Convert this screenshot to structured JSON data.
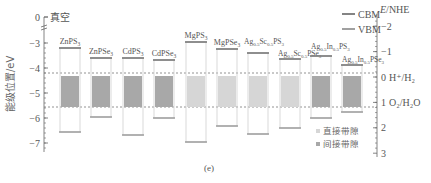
{
  "chart_data": {
    "type": "bar",
    "subtype": "band-edge floating bars",
    "panel_label": "(e)",
    "ylabel": "能级位置/eV",
    "ylabel_right": "E/NHE",
    "vacuum_label": "真空",
    "left_axis": {
      "ticks": [
        0,
        -3,
        -4,
        -5,
        -6,
        -7
      ],
      "range": [
        -7.4,
        0
      ],
      "axis_break_between": [
        0,
        -3
      ]
    },
    "right_axis": {
      "ticks": [
        -2,
        -1,
        0,
        1,
        2,
        3
      ],
      "range": [
        -2.4,
        3
      ]
    },
    "reference_lines": [
      {
        "label": "H+/H2",
        "label_display": "0 H⁺/H₂",
        "value_vacuum": -4.44,
        "value_nhe": 0
      },
      {
        "label": "O2/H2O",
        "label_display": "O₂/H₂O",
        "value_vacuum": -5.67,
        "value_nhe": 1.23
      }
    ],
    "legend": [
      {
        "key": "CBM",
        "label": "CBM"
      },
      {
        "key": "VBM",
        "label": "VBM"
      },
      {
        "key": "direct",
        "label": "直接带隙",
        "color": "#d6d6d6"
      },
      {
        "key": "indirect",
        "label": "间接带隙",
        "color": "#a8a8a8"
      }
    ],
    "categories": [
      "ZnPS3",
      "ZnPSe3",
      "CdPS3",
      "CdPSe3",
      "MgPS3",
      "MgPSe3",
      "Ag0.5Sc0.5PS3",
      "Ag0.5Sc0.5PSe3",
      "Ag0.5In0.5PS3",
      "Ag0.5In0.5PSe3"
    ],
    "series": [
      {
        "name": "CBM",
        "values": [
          -3.2,
          -3.6,
          -3.6,
          -3.68,
          -2.96,
          -3.24,
          -3.4,
          -3.64,
          -3.52,
          -3.88
        ]
      },
      {
        "name": "VBM",
        "values": [
          -6.56,
          -5.96,
          -6.68,
          -6.0,
          -6.96,
          -6.32,
          -6.64,
          -6.4,
          -6.0,
          -5.76
        ]
      }
    ],
    "gap_type": [
      "indirect",
      "indirect",
      "indirect",
      "indirect",
      "direct",
      "direct",
      "direct",
      "direct",
      "indirect",
      "indirect"
    ],
    "materials": [
      {
        "name": "ZnPS3",
        "base": "ZnPS",
        "sub": "3",
        "cbm": -3.2,
        "vbm": -6.56,
        "gap": "indirect"
      },
      {
        "name": "ZnPSe3",
        "base": "ZnPSe",
        "sub": "3",
        "cbm": -3.6,
        "vbm": -5.96,
        "gap": "indirect"
      },
      {
        "name": "CdPS3",
        "base": "CdPS",
        "sub": "3",
        "cbm": -3.6,
        "vbm": -6.68,
        "gap": "indirect"
      },
      {
        "name": "CdPSe3",
        "base": "CdPSe",
        "sub": "3",
        "cbm": -3.68,
        "vbm": -6.0,
        "gap": "indirect"
      },
      {
        "name": "MgPS3",
        "base": "MgPS",
        "sub": "3",
        "cbm": -2.96,
        "vbm": -6.96,
        "gap": "direct"
      },
      {
        "name": "MgPSe3",
        "base": "MgPSe",
        "sub": "3",
        "cbm": -3.24,
        "vbm": -6.32,
        "gap": "direct"
      },
      {
        "name": "Ag0.5Sc0.5PS3",
        "label_parts": [
          "Ag",
          "0.5",
          "Sc",
          "0.5",
          "PS",
          "3"
        ],
        "cbm": -3.4,
        "vbm": -6.64,
        "gap": "direct"
      },
      {
        "name": "Ag0.5Sc0.5PSe3",
        "label_parts": [
          "Ag",
          "0.5",
          "Sc",
          "0.5",
          "PSe",
          "3"
        ],
        "cbm": -3.64,
        "vbm": -6.4,
        "gap": "direct"
      },
      {
        "name": "Ag0.5In0.5PS3",
        "label_parts": [
          "Ag",
          "0.5",
          "In",
          "0.5",
          "PS",
          "3"
        ],
        "cbm": -3.52,
        "vbm": -6.0,
        "gap": "indirect"
      },
      {
        "name": "Ag0.5In0.5PSe3",
        "label_parts": [
          "Ag",
          "0.5",
          "In",
          "0.5",
          "PSe",
          "3"
        ],
        "cbm": -3.88,
        "vbm": -5.76,
        "gap": "indirect"
      }
    ],
    "colors": {
      "direct": "#d6d6d6",
      "indirect": "#a8a8a8",
      "band_edge": "#777777",
      "bar_outline": "#cfcfcf",
      "axis": "#666666",
      "dashed": "#777777"
    }
  }
}
